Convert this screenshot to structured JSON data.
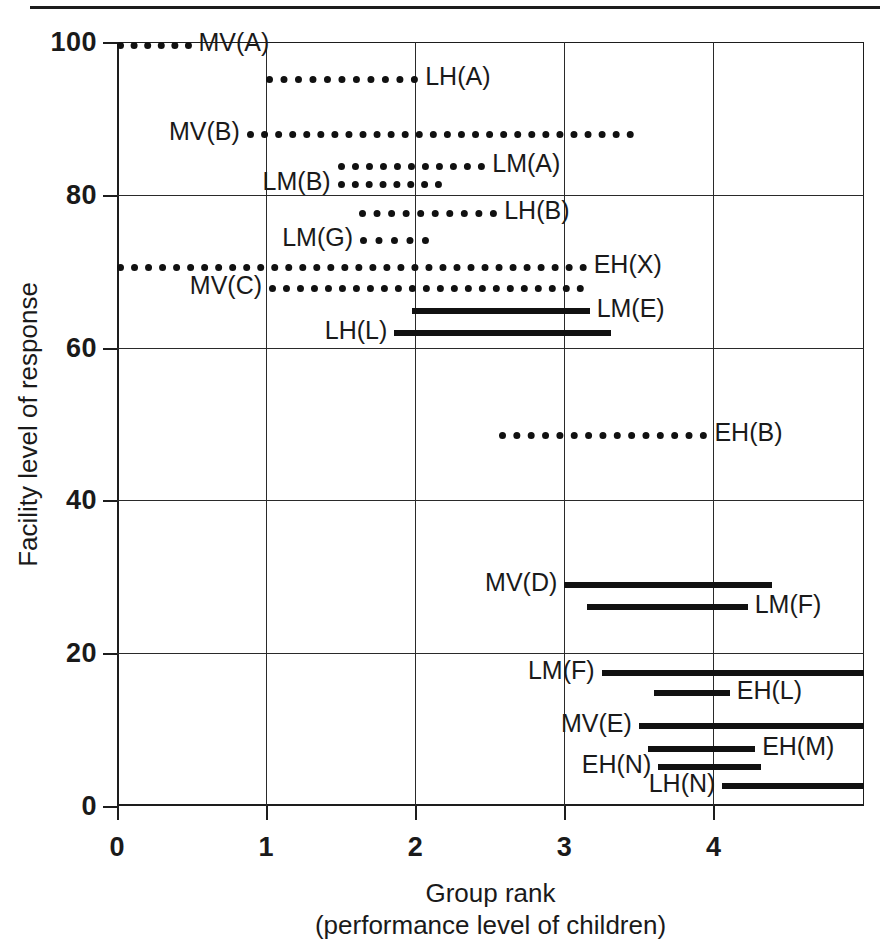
{
  "chart_data": {
    "type": "bar",
    "orientation": "horizontal-ranges",
    "title": "",
    "xlabel_line1": "Group rank",
    "xlabel_line2": "(performance level of children)",
    "ylabel": "Facility level of response",
    "xlim": [
      0,
      5.01
    ],
    "ylim": [
      0,
      100
    ],
    "xticks": [
      "0",
      "1",
      "2",
      "3",
      "4"
    ],
    "xtick_values": [
      0,
      1,
      2,
      3,
      4
    ],
    "yticks": [
      "0",
      "20",
      "40",
      "60",
      "80",
      "100"
    ],
    "ytick_values": [
      0,
      20,
      40,
      60,
      80,
      100
    ],
    "grid": "both",
    "legend": "none",
    "series_note": "Each horizontal segment spans the group-rank range over which a group's facility level of response was observed. Dotted segments and solid segments denote two different sets.",
    "items": [
      {
        "label": "MV(A)",
        "y": 100,
        "x0": 0.0,
        "x1": 0.5,
        "style": "dotted",
        "label_side": "right"
      },
      {
        "label": "LH(A)",
        "y": 95.5,
        "x0": 1.0,
        "x1": 2.02,
        "style": "dotted",
        "label_side": "right"
      },
      {
        "label": "MV(B)",
        "y": 88.4,
        "x0": 0.87,
        "x1": 3.47,
        "style": "dotted",
        "label_side": "left"
      },
      {
        "label": "LM(A)",
        "y": 84.2,
        "x0": 1.48,
        "x1": 2.47,
        "style": "dotted",
        "label_side": "right"
      },
      {
        "label": "LM(B)",
        "y": 81.8,
        "x0": 1.48,
        "x1": 2.18,
        "style": "dotted",
        "label_side": "left"
      },
      {
        "label": "LH(B)",
        "y": 78.0,
        "x0": 1.62,
        "x1": 2.55,
        "style": "dotted",
        "label_side": "right"
      },
      {
        "label": "LM(G)",
        "y": 74.5,
        "x0": 1.63,
        "x1": 2.09,
        "style": "dotted",
        "label_side": "left"
      },
      {
        "label": "EH(X)",
        "y": 71.0,
        "x0": 0.0,
        "x1": 3.15,
        "style": "dotted",
        "label_side": "right"
      },
      {
        "label": "MV(C)",
        "y": 68.2,
        "x0": 1.02,
        "x1": 3.13,
        "style": "dotted",
        "label_side": "left"
      },
      {
        "label": "LM(E)",
        "y": 65.2,
        "x0": 1.98,
        "x1": 3.17,
        "style": "solid",
        "label_side": "right"
      },
      {
        "label": "LH(L)",
        "y": 62.3,
        "x0": 1.86,
        "x1": 3.31,
        "style": "solid",
        "label_side": "left"
      },
      {
        "label": "EH(B)",
        "y": 49.0,
        "x0": 2.56,
        "x1": 3.96,
        "style": "dotted",
        "label_side": "right"
      },
      {
        "label": "MV(D)",
        "y": 29.3,
        "x0": 3.0,
        "x1": 4.39,
        "style": "solid",
        "label_side": "left"
      },
      {
        "label": "LM(F)",
        "y": 26.4,
        "x0": 3.15,
        "x1": 4.23,
        "style": "solid",
        "label_side": "right"
      },
      {
        "label": "LM(F)",
        "y": 17.8,
        "x0": 3.25,
        "x1": 5.01,
        "style": "solid",
        "label_side": "left"
      },
      {
        "label": "EH(L)",
        "y": 15.2,
        "x0": 3.6,
        "x1": 4.11,
        "style": "solid",
        "label_side": "right"
      },
      {
        "label": "MV(E)",
        "y": 10.9,
        "x0": 3.5,
        "x1": 5.01,
        "style": "solid",
        "label_side": "left"
      },
      {
        "label": "EH(M)",
        "y": 7.9,
        "x0": 3.56,
        "x1": 4.28,
        "style": "solid",
        "label_side": "right"
      },
      {
        "label": "EH(N)",
        "y": 5.5,
        "x0": 3.63,
        "x1": 4.32,
        "style": "solid",
        "label_side": "left"
      },
      {
        "label": "LH(N)",
        "y": 3.0,
        "x0": 4.06,
        "x1": 5.01,
        "style": "solid",
        "label_side": "left"
      }
    ],
    "colors": {
      "ink": "#111111",
      "axis": "#1d1d1d",
      "grid": "#2a2a2a",
      "background": "#ffffff"
    }
  }
}
